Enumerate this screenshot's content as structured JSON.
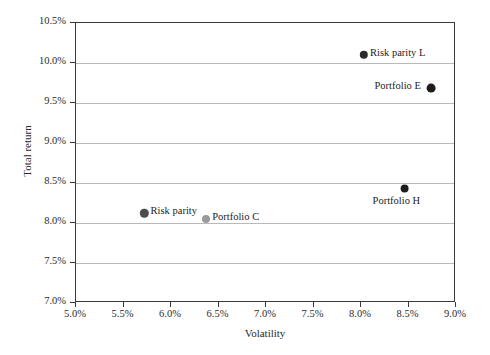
{
  "chart_data": {
    "type": "scatter",
    "title": "",
    "xlabel": "Volatility",
    "ylabel": "Total return",
    "xlim": [
      5.0,
      9.0
    ],
    "ylim": [
      7.0,
      10.5
    ],
    "xticks": [
      "5.0%",
      "5.5%",
      "6.0%",
      "6.5%",
      "7.0%",
      "7.5%",
      "8.0%",
      "8.5%",
      "9.0%"
    ],
    "yticks": [
      "7.0%",
      "7.5%",
      "8.0%",
      "8.5%",
      "9.0%",
      "9.5%",
      "10.0%",
      "10.5%"
    ],
    "xtick_values": [
      5.0,
      5.5,
      6.0,
      6.5,
      7.0,
      7.5,
      8.0,
      8.5,
      9.0
    ],
    "ytick_values": [
      7.0,
      7.5,
      8.0,
      8.5,
      9.0,
      9.5,
      10.0,
      10.5
    ],
    "grid": "horizontal",
    "legend": "none",
    "points": [
      {
        "name": "Risk parity L",
        "x": 8.03,
        "y": 10.1,
        "color": "#2b2b2b",
        "radius": 4.2,
        "label_side": "right"
      },
      {
        "name": "Portfolio E",
        "x": 8.74,
        "y": 9.69,
        "color": "#1d1d1d",
        "radius": 4.4,
        "label_side": "left"
      },
      {
        "name": "Portfolio H",
        "x": 8.46,
        "y": 8.43,
        "color": "#1d1d1d",
        "radius": 4.4,
        "label_side": "below"
      },
      {
        "name": "Risk parity",
        "x": 5.72,
        "y": 8.12,
        "color": "#4d4d4d",
        "radius": 4.2,
        "label_side": "right"
      },
      {
        "name": "Portfolio C",
        "x": 6.37,
        "y": 8.05,
        "color": "#9a9a9a",
        "radius": 4.0,
        "label_side": "right"
      }
    ]
  },
  "axes": {
    "x_title": "Volatility",
    "y_title": "Total return"
  },
  "colors": {
    "axis": "#3a3a3a",
    "grid": "#b9b9b9",
    "text": "#2b2b2b",
    "background": "#ffffff"
  }
}
